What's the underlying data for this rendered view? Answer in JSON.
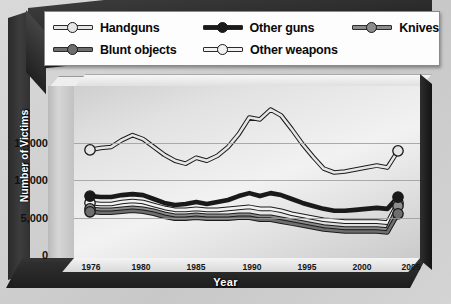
{
  "legend": {
    "rows": [
      [
        {
          "label": "Handguns",
          "color": "#e6e6e6"
        },
        {
          "label": "Other guns",
          "color": "#1a1a1a"
        },
        {
          "label": "Knives",
          "color": "#8c8c8c"
        }
      ],
      [
        {
          "label": "Blunt objects",
          "color": "#6e6e6e"
        },
        {
          "label": "Other weapons",
          "color": "#f2f2f2"
        }
      ]
    ]
  },
  "axes": {
    "ylabel": "Number of Victims",
    "xlabel": "Year",
    "yticks": [
      "0",
      "5,000",
      "10,000",
      "15,000"
    ],
    "xticks": [
      "1976",
      "1980",
      "1985",
      "1990",
      "1995",
      "2000",
      "2005"
    ]
  },
  "chart_data": {
    "type": "line",
    "title": "",
    "xlabel": "Year",
    "ylabel": "Number of Victims",
    "ylim": [
      0,
      17500
    ],
    "xlim": [
      1976,
      2005
    ],
    "grid": true,
    "legend_position": "top",
    "x": [
      1976,
      1977,
      1978,
      1979,
      1980,
      1981,
      1982,
      1983,
      1984,
      1985,
      1986,
      1987,
      1988,
      1989,
      1990,
      1991,
      1992,
      1993,
      1994,
      1995,
      1996,
      1997,
      1998,
      1999,
      2000,
      2001,
      2002,
      2003,
      2004,
      2005
    ],
    "series": [
      {
        "name": "Handguns",
        "color": "#e6e6e6",
        "values": [
          11000,
          11200,
          11300,
          12000,
          12500,
          12100,
          11300,
          10500,
          9900,
          9600,
          10200,
          9900,
          10400,
          11300,
          12600,
          14300,
          14100,
          15100,
          14500,
          13100,
          11600,
          10300,
          9100,
          8700,
          8800,
          9000,
          9200,
          9400,
          9200,
          10900
        ]
      },
      {
        "name": "Other guns",
        "color": "#1a1a1a",
        "values": [
          6300,
          6200,
          6200,
          6400,
          6500,
          6400,
          6000,
          5600,
          5400,
          5500,
          5700,
          5500,
          5700,
          5900,
          6300,
          6600,
          6300,
          6600,
          6400,
          6000,
          5600,
          5300,
          5000,
          4800,
          4800,
          4900,
          5000,
          5100,
          5000,
          6200
        ]
      },
      {
        "name": "Knives",
        "color": "#8c8c8c",
        "values": [
          5000,
          4900,
          4900,
          5000,
          5100,
          5000,
          4800,
          4500,
          4300,
          4300,
          4400,
          4300,
          4300,
          4300,
          4400,
          4400,
          4200,
          4200,
          4000,
          3800,
          3600,
          3400,
          3200,
          3100,
          3000,
          3000,
          3000,
          3000,
          2900,
          5300
        ]
      },
      {
        "name": "Blunt objects",
        "color": "#6e6e6e",
        "values": [
          4700,
          4600,
          4600,
          4700,
          4800,
          4700,
          4500,
          4200,
          4000,
          4000,
          4100,
          4000,
          4000,
          4000,
          4100,
          4100,
          3900,
          3900,
          3700,
          3500,
          3300,
          3100,
          2900,
          2800,
          2700,
          2700,
          2700,
          2700,
          2600,
          4500
        ]
      },
      {
        "name": "Other weapons",
        "color": "#f2f2f2",
        "values": [
          5600,
          5500,
          5500,
          5700,
          5800,
          5700,
          5400,
          5100,
          4900,
          4900,
          5000,
          4900,
          4900,
          5000,
          5100,
          5200,
          5000,
          5000,
          4800,
          4500,
          4300,
          4100,
          3900,
          3800,
          3700,
          3700,
          3700,
          3700,
          3600,
          5600
        ]
      }
    ]
  }
}
